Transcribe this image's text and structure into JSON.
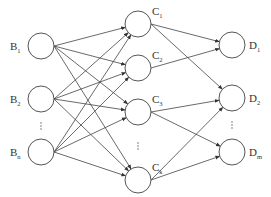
{
  "diagram": {
    "type": "neural-network",
    "layers": [
      {
        "name": "input",
        "nodes": [
          {
            "id": "B1",
            "label": "B",
            "sub": "1",
            "x": 41,
            "y": 46
          },
          {
            "id": "B2",
            "label": "B",
            "sub": "2",
            "x": 41,
            "y": 99
          },
          {
            "id": "Bn",
            "label": "B",
            "sub": "n",
            "x": 41,
            "y": 152
          }
        ],
        "ellipsis": {
          "x": 41,
          "y": 126
        }
      },
      {
        "name": "hidden",
        "nodes": [
          {
            "id": "C1",
            "label": "C",
            "sub": "1",
            "x": 138,
            "y": 24
          },
          {
            "id": "C2",
            "label": "C",
            "sub": "2",
            "x": 138,
            "y": 68
          },
          {
            "id": "C3",
            "label": "C",
            "sub": "3",
            "x": 138,
            "y": 112
          },
          {
            "id": "Ck",
            "label": "C",
            "sub": "k",
            "x": 138,
            "y": 180
          }
        ],
        "ellipsis": {
          "x": 138,
          "y": 146
        }
      },
      {
        "name": "output",
        "nodes": [
          {
            "id": "D1",
            "label": "D",
            "sub": "1",
            "x": 232,
            "y": 45
          },
          {
            "id": "D2",
            "label": "D",
            "sub": "2",
            "x": 232,
            "y": 98
          },
          {
            "id": "Dm",
            "label": "D",
            "sub": "m",
            "x": 232,
            "y": 152
          }
        ],
        "ellipsis": {
          "x": 232,
          "y": 125
        }
      }
    ],
    "edges": [
      [
        "B1",
        "C1"
      ],
      [
        "B1",
        "C2"
      ],
      [
        "B1",
        "C3"
      ],
      [
        "B1",
        "Ck"
      ],
      [
        "B2",
        "C1"
      ],
      [
        "B2",
        "C2"
      ],
      [
        "B2",
        "C3"
      ],
      [
        "B2",
        "Ck"
      ],
      [
        "Bn",
        "C1"
      ],
      [
        "Bn",
        "C2"
      ],
      [
        "Bn",
        "C3"
      ],
      [
        "Bn",
        "Ck"
      ],
      [
        "C1",
        "D1"
      ],
      [
        "C1",
        "D2"
      ],
      [
        "C2",
        "D1"
      ],
      [
        "C3",
        "D2"
      ],
      [
        "C3",
        "Dm"
      ],
      [
        "Ck",
        "D2"
      ],
      [
        "Ck",
        "Dm"
      ]
    ],
    "node_radius": 13,
    "colors": {
      "stroke": "#555555",
      "edge": "#444444",
      "text": "#333333"
    }
  }
}
